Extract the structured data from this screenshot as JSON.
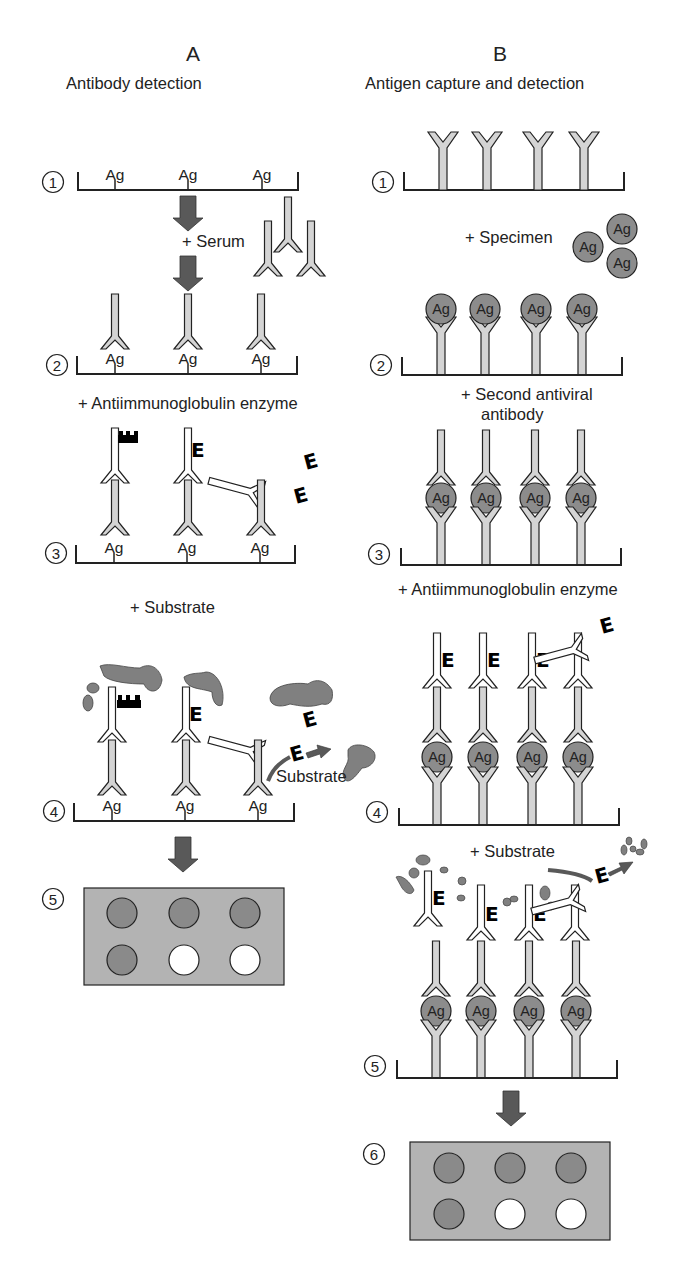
{
  "figure": {
    "colors": {
      "antibody_fill": "#d4d4d4",
      "antigen_fill": "#8c8c8c",
      "conjugate_fill": "#ffffff",
      "arrow_fill": "#595959",
      "substrate_blob": "#808080",
      "plate_fill": "#b3b3b3",
      "well_positive": "#8a8a8a",
      "well_negative": "#ffffff",
      "enzyme": "#000000",
      "outline": "#222222"
    },
    "panel_a": {
      "letter": "A",
      "title": "Antibody detection",
      "antigen_label": "Ag",
      "enzyme_label": "E",
      "steps": [
        {
          "number": "1"
        },
        {
          "number": "2",
          "reagent": "+ Serum"
        },
        {
          "number": "3",
          "reagent": "+ Antiimmunoglobulin enzyme"
        },
        {
          "number": "4",
          "reagent": "+ Substrate",
          "inline_label": "Substrate"
        },
        {
          "number": "5"
        }
      ],
      "plate": {
        "rows": [
          [
            "positive",
            "positive",
            "positive"
          ],
          [
            "positive",
            "negative",
            "negative"
          ]
        ]
      }
    },
    "panel_b": {
      "letter": "B",
      "title": "Antigen capture and detection",
      "antigen_label": "Ag",
      "enzyme_label": "E",
      "steps": [
        {
          "number": "1"
        },
        {
          "number": "2",
          "reagent": "+ Specimen"
        },
        {
          "number": "3",
          "reagent_line1": "+ Second antiviral",
          "reagent_line2": "antibody"
        },
        {
          "number": "4",
          "reagent": "+ Antiimmunoglobulin enzyme"
        },
        {
          "number": "5",
          "reagent": "+ Substrate"
        },
        {
          "number": "6"
        }
      ],
      "plate": {
        "rows": [
          [
            "positive",
            "positive",
            "positive"
          ],
          [
            "positive",
            "negative",
            "negative"
          ]
        ]
      }
    }
  }
}
